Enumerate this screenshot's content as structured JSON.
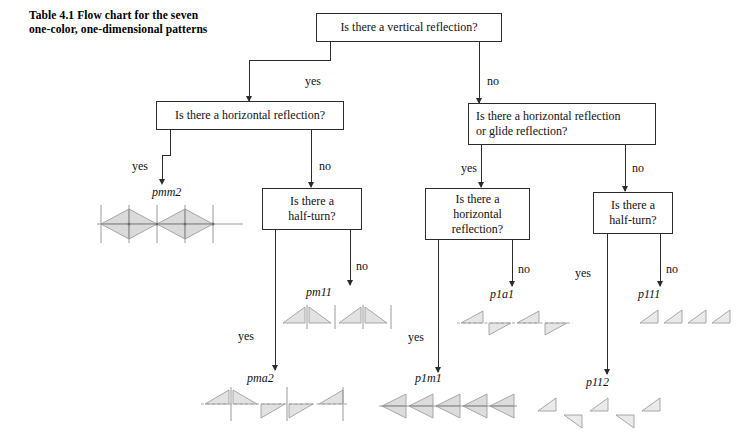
{
  "caption": {
    "line1": "Table 4.1   Flow chart for the seven",
    "line2": "one-color, one-dimensional patterns"
  },
  "questions": {
    "root": "Is there a vertical reflection?",
    "left_horiz": "Is there a horizontal reflection?",
    "right_horiz_glide_l1": "Is there a horizontal reflection",
    "right_horiz_glide_l2": "or glide reflection?",
    "left_halfturn_l1": "Is there a",
    "left_halfturn_l2": "half-turn?",
    "mid_horiz_l1": "Is there a",
    "mid_horiz_l2": "horizontal",
    "mid_horiz_l3": "reflection?",
    "right_halfturn_l1": "Is there a",
    "right_halfturn_l2": "half-turn?"
  },
  "edge_labels": {
    "root_yes": "yes",
    "root_no": "no",
    "left_yes": "yes",
    "left_no": "no",
    "right_yes": "yes",
    "right_no": "no",
    "halfturn_l_yes": "yes",
    "halfturn_l_no": "no",
    "midhoriz_no": "no",
    "midhoriz_yes": "yes",
    "halfturn_r_yes": "yes",
    "halfturn_r_no": "no"
  },
  "patterns": {
    "pmm2": "pmm2",
    "pm11": "pm11",
    "pma2": "pma2",
    "p1a1": "p1a1",
    "p1m1": "p1m1",
    "p111": "p111",
    "p112": "p112"
  },
  "colors": {
    "line": "#2b2b2b",
    "figure_stroke": "#9a9a9a",
    "figure_fill": "#d9d9d9",
    "text": "#111111",
    "background": "#ffffff"
  }
}
